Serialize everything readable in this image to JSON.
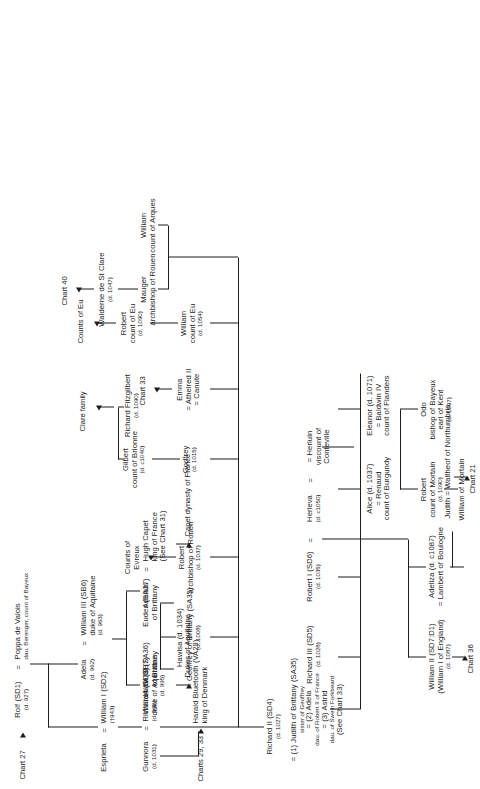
{
  "document": {
    "type": "genealogical-chart",
    "title": "Chart 27",
    "subject": "Dukes of Normandy",
    "orientation": "rotated-90-counterclockwise",
    "page_background": "#ffffff",
    "ink_color": "#1c1c1c"
  },
  "refs": {
    "chart_27": "Chart 27",
    "charts_29_33": "Charts 29, 33",
    "chart_31": "(See Chart 31)",
    "chart_33_node": "Chart 33",
    "see_chart_33": "(See Chart 33)",
    "chart_36": "Chart 36",
    "chart_40": "Chart 40",
    "chart_21": "Chart 21"
  },
  "outcomes": {
    "capet": "Capet dynasty of France",
    "aquitaine": "Dukes of Aquitaine",
    "eu": "Counts of Eu",
    "evreux_1": "Counts of",
    "evreux_2": "Evreux",
    "clare": "Clare family"
  },
  "people": {
    "rolf": {
      "name": "Rolf (SD1)",
      "dates": "(d. 927)"
    },
    "poppa": {
      "name": "Poppa de Valois",
      "detail": "dau. Berenger, count of Bayeux"
    },
    "adela": {
      "name": "Adela",
      "dates": "(d. 962)"
    },
    "william_iii_aq": {
      "name": "William III (SB6)",
      "title": "duke of Aquitaine",
      "dates": "(d. 963)"
    },
    "william_iv_aq": {
      "name": "William IV (SB7)",
      "title": "duke of Aquitaine",
      "dates": "(d. 995)"
    },
    "adelais": {
      "name": "Adelais"
    },
    "hugh_capet": {
      "name": "Hugh Capet",
      "title": "king of France"
    },
    "esprieta": {
      "name": "Esprieta"
    },
    "william_i": {
      "name": "William I (SD2)",
      "dates": "(†943)"
    },
    "gunnora": {
      "name": "Gunnora",
      "dates": "(d. 1031)"
    },
    "richard_i": {
      "name": "Richard I (SD3)",
      "dates": "(d. 996)"
    },
    "harald": {
      "name": "Harald Bluetooth (VA29)",
      "title": "king of Denmark"
    },
    "richard_ii": {
      "name": "Richard II (SD4)",
      "dates": "(d. 1027)",
      "marriages": [
        "= (1) Judith of Brittany (SA35)",
        "sister of Geoffrey",
        "= (2) Adela",
        "dau. of Robert II of France",
        "= (3) Astrid",
        "dau. of Swein Forkbeard"
      ]
    },
    "hawisa": {
      "name": "Hawisa (d. 1034)"
    },
    "geoffrey_brittany": {
      "name": "= Geoffrey of Brittany (SA35)",
      "dates": "(d. 1008)"
    },
    "alain_iii": {
      "name": "Alain III (SA36)",
      "title": "of Brittany"
    },
    "eudes": {
      "name": "Eudes (SA37)",
      "title": "of Brittany"
    },
    "robert_abp_rouen": {
      "name": "Robert",
      "title": "archbishop of Rouen",
      "dates": "(d. 1037)"
    },
    "godfrey": {
      "name": "Godfrey",
      "dates": "(d. 1015)"
    },
    "gilbert": {
      "name": "Gilbert",
      "title": "count of Brionne",
      "dates": "(d. c1040)"
    },
    "richard_fitzgilbert": {
      "name": "Richard Fitzgilbert",
      "dates": "(d. 1090)"
    },
    "emma": {
      "name": "Emma",
      "marriages": [
        "= Athelred II",
        "= Canute"
      ]
    },
    "william_eu": {
      "name": "William",
      "title": "count of Eu",
      "dates": "(d. 1054)"
    },
    "robert_eu": {
      "name": "Robert",
      "title": "count of Eu",
      "dates": "(d. 1090)"
    },
    "mauger": {
      "name": "Mauger",
      "title": "archbishop of Rouen"
    },
    "walderne": {
      "name": "Walderne de St Clare",
      "dates": "(d. 1047)"
    },
    "william_arques": {
      "name": "William",
      "title": "count of Arques"
    },
    "richard_iii": {
      "name": "Richard III (SD5)",
      "dates": "(d. 1028)"
    },
    "robert_i": {
      "name": "Robert I (SD6)",
      "dates": "(d. 1035)"
    },
    "herleva": {
      "name": "Herleva",
      "dates": "(d. c1050)"
    },
    "herluin": {
      "name": "= Herluin",
      "title": "viscount of",
      "detail": "Conteville"
    },
    "alice": {
      "name": "Alice (d. 1037)",
      "spouse": "= Renaud",
      "title": "count of Burgundy"
    },
    "eleanor": {
      "name": "Eleanor (d. 1071)",
      "spouse": "= Baldwin IV",
      "title": "count of Flanders"
    },
    "william_ii": {
      "name": "William II (SD7:D1)",
      "alt": "(William I of England)",
      "dates": "(d. 1087)"
    },
    "adeliza": {
      "name": "Adeliza (d. c1087)",
      "spouse": "= Lambert of Boulogne"
    },
    "judith": {
      "name": "Judith = Waltheof of Northumbria"
    },
    "odo": {
      "name": "Odo",
      "title": "bishop of Bayeux",
      "title2": "earl of Kent",
      "dates": "(d. 1097)"
    },
    "robert_mortain": {
      "name": "Robert",
      "title": "count of Mortain",
      "dates": "(d. 1090)"
    },
    "william_mortain": {
      "name": "William of Mortain"
    }
  },
  "symbols": {
    "marriage": "=",
    "arrow": "→"
  }
}
